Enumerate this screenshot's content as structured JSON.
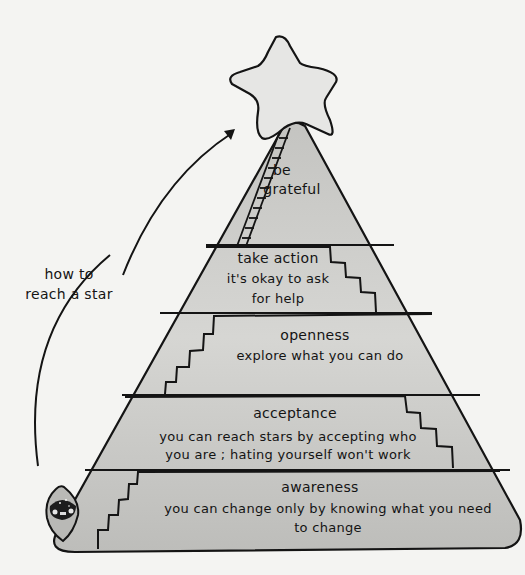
{
  "colors": {
    "background": "#f4f4f2",
    "pyramid_fill": "#c9c9c6",
    "star_fill": "#e6e6e4",
    "ink": "#141414"
  },
  "annotation": {
    "line1": "how to",
    "line2": "reach a star"
  },
  "summit": {
    "line1": "be",
    "line2": "grateful"
  },
  "levels": [
    {
      "heading": "take action",
      "lines": [
        "it's okay to ask",
        "for help"
      ]
    },
    {
      "heading": "openness",
      "lines": [
        "explore what you can do"
      ]
    },
    {
      "heading": "acceptance",
      "lines": [
        "you can reach stars by accepting who",
        "you are ; hating yourself won't work"
      ]
    },
    {
      "heading": "awareness",
      "lines": [
        "you can change only by knowing what you need",
        "to change"
      ]
    }
  ],
  "icons": {
    "star": "star-icon",
    "ladder": "ladder-icon",
    "arrow": "arrow-icon",
    "character": "character-icon"
  }
}
